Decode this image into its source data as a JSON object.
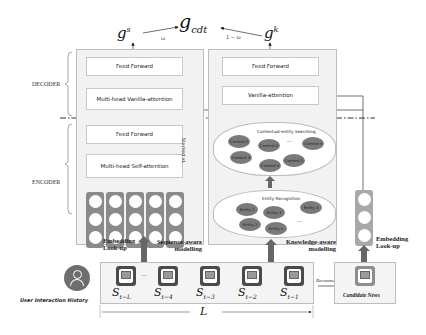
{
  "outputs": {
    "g_s": "g",
    "g_s_sup": "s",
    "g_cdt": "g",
    "g_cdt_sub": "cdt",
    "g_k": "g",
    "g_k_sup": "k",
    "omega": "ω",
    "one_minus_omega": "1 − ω"
  },
  "side_labels": {
    "decoder": "DECODER",
    "encoder": "ENCODER"
  },
  "sequence_branch": {
    "decoder_feed_forward": "Feed Forward",
    "decoder_attention": "Multi-head Vanilla-attention",
    "encoder_feed_forward": "Feed Forward",
    "encoder_attention": "Multi-head Self-attention",
    "stacked_label": "Stacked ×L",
    "embedding_label": "Embedding Look-up",
    "modelling_label": "Sequence-aware modelling"
  },
  "knowledge_branch": {
    "decoder_feed_forward": "Feed Forward",
    "decoder_attention": "Vanilla-attention",
    "contextual_title": "Contextual-entity Searching",
    "contexts": [
      "Context 1",
      "Context 2",
      "Context n",
      "Context 3",
      "Context 5",
      "Context 4"
    ],
    "entity_title": "Entity Recognition",
    "entities": [
      "Entity 1",
      "Entity 3",
      "Entity 4",
      "Entity 2",
      "Entity n"
    ],
    "ellipsis": "...",
    "modelling_label": "Knowledge-aware modelling"
  },
  "candidate": {
    "embedding_label": "Embedding Look-up",
    "recommend_label": "Recommend",
    "news_label": "Candidate News"
  },
  "history": {
    "user_label": "User Interaction History",
    "items": [
      {
        "base": "S",
        "sub": "t−L"
      },
      {
        "base": "S",
        "sub": "t−4"
      },
      {
        "base": "S",
        "sub": "t−3"
      },
      {
        "base": "S",
        "sub": "t−2"
      },
      {
        "base": "S",
        "sub": "t−1"
      }
    ],
    "ellipsis": "...",
    "length_label": "L"
  }
}
